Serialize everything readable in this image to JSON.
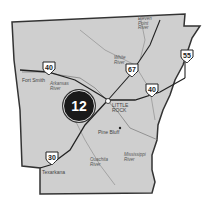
{
  "map": {
    "region": "Arkansas",
    "fill_color": "#cfcfcf",
    "border_color": "#333333",
    "marker": {
      "label": "12",
      "color": "#1a1a1a"
    },
    "cities": [
      {
        "name": "Fort Smith"
      },
      {
        "name": "LITTLE ROCK"
      },
      {
        "name": "Pine Bluff"
      },
      {
        "name": "Texarkana"
      }
    ],
    "rivers": [
      {
        "name": "Eleven Point River"
      },
      {
        "name": "White River"
      },
      {
        "name": "Arkansas River"
      },
      {
        "name": "Ouachita River"
      },
      {
        "name": "Mississippi River"
      }
    ],
    "highways": [
      {
        "number": "40",
        "position": "west"
      },
      {
        "number": "67"
      },
      {
        "number": "55"
      },
      {
        "number": "40",
        "position": "east"
      },
      {
        "number": "30"
      }
    ]
  }
}
